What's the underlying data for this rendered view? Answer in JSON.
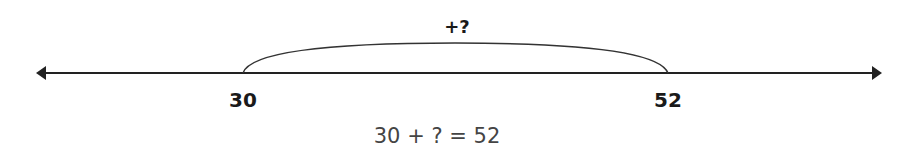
{
  "number_line": {
    "start_label": "30",
    "end_label": "52",
    "jump_label": "+?",
    "line_color": "#222222"
  },
  "equation": "30 + ? = 52"
}
